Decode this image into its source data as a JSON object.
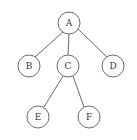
{
  "diagram": {
    "type": "tree",
    "root": "A",
    "nodes": [
      {
        "id": "A",
        "label": "A",
        "x": 69,
        "y": 23
      },
      {
        "id": "B",
        "label": "B",
        "x": 29,
        "y": 66
      },
      {
        "id": "C",
        "label": "C",
        "x": 68,
        "y": 66
      },
      {
        "id": "D",
        "label": "D",
        "x": 113,
        "y": 66
      },
      {
        "id": "E",
        "label": "E",
        "x": 38,
        "y": 117
      },
      {
        "id": "F",
        "label": "F",
        "x": 89,
        "y": 117
      }
    ],
    "edges": [
      {
        "from": "A",
        "to": "B"
      },
      {
        "from": "A",
        "to": "C"
      },
      {
        "from": "A",
        "to": "D"
      },
      {
        "from": "C",
        "to": "E"
      },
      {
        "from": "C",
        "to": "F"
      }
    ],
    "node_radius": 11,
    "colors": {
      "stroke": "#6a6a6a",
      "text": "#333333",
      "background": "#ffffff"
    }
  }
}
